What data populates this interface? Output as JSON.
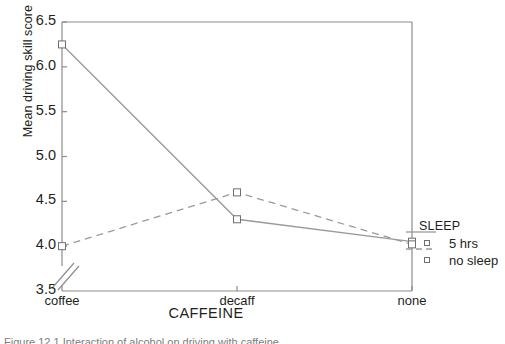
{
  "chart_data": {
    "type": "line",
    "title": "",
    "xlabel": "CAFFEINE",
    "ylabel": "Mean driving skill score",
    "categories": [
      "coffee",
      "decaff",
      "none"
    ],
    "ylim": [
      3.5,
      6.5
    ],
    "yticks": [
      "3.5",
      "4.0",
      "4.5",
      "5.0",
      "5.5",
      "6.0",
      "6.5"
    ],
    "ytick_values": [
      3.5,
      4.0,
      4.5,
      5.0,
      5.5,
      6.0,
      6.5
    ],
    "grid": false,
    "axis_break": true,
    "legend_position": "right-outside",
    "legend_title": "SLEEP",
    "series": [
      {
        "name": "5 hrs",
        "style": "solid",
        "marker": "open-square",
        "values": [
          6.25,
          4.3,
          4.05
        ]
      },
      {
        "name": "no sleep",
        "style": "dashed",
        "marker": "open-square",
        "values": [
          4.0,
          4.6,
          4.02
        ]
      }
    ]
  },
  "colors": {
    "line": "#9a9a9a",
    "axis": "#8c8c8c",
    "text": "#231f20",
    "marker_edge": "#6f6f6f"
  },
  "caption": {
    "text": "Figure 12.1 Interaction of alcohol on driving with caffeine"
  }
}
